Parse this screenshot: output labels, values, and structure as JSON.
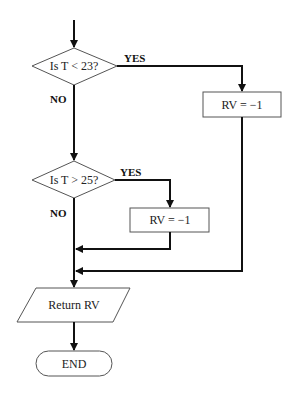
{
  "diagram": {
    "type": "flowchart",
    "nodes": {
      "decision1": {
        "label": "Is T < 23?"
      },
      "process1": {
        "label": "RV = −1"
      },
      "decision2": {
        "label": "Is T > 25?"
      },
      "process2": {
        "label": "RV = −1"
      },
      "output": {
        "label": "Return RV"
      },
      "end": {
        "label": "END"
      }
    },
    "branches": {
      "d1_yes": "YES",
      "d1_no": "NO",
      "d2_yes": "YES",
      "d2_no": "NO"
    },
    "colors": {
      "stroke": "#111111",
      "shape_border": "#555555",
      "background": "#ffffff"
    }
  }
}
